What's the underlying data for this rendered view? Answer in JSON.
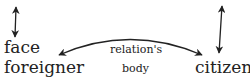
{
  "labels": {
    "face": "face",
    "foreigner": "foreigner",
    "relation": "relation's",
    "body": "body",
    "citizen": "citizen"
  },
  "arrows": [
    {
      "name": "left-vertical-double-arrow",
      "type": "double-headed"
    },
    {
      "name": "curved-double-arrow",
      "type": "double-headed",
      "from": "foreigner",
      "to": "citizen"
    },
    {
      "name": "right-vertical-double-arrow",
      "type": "double-headed"
    }
  ],
  "colors": {
    "ink": "#222222",
    "background": "#ffffff"
  }
}
